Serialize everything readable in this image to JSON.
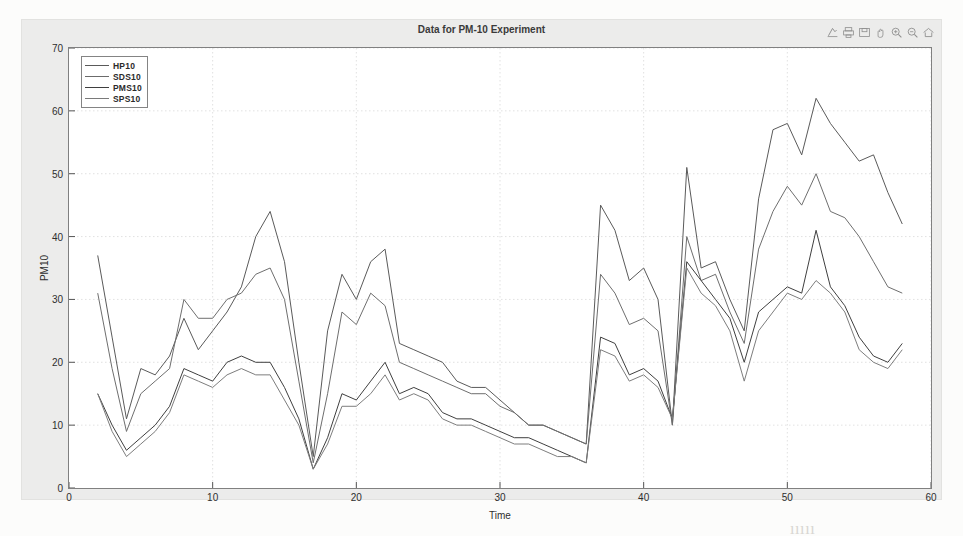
{
  "figure": {
    "title": "Data for PM-10 Experiment",
    "toolbar": [
      {
        "name": "print-preview-icon",
        "label": "Print Preview"
      },
      {
        "name": "print-icon",
        "label": "Print"
      },
      {
        "name": "save-icon",
        "label": "Save"
      },
      {
        "name": "pan-hand-icon",
        "label": "Pan"
      },
      {
        "name": "zoom-in-icon",
        "label": "Zoom In"
      },
      {
        "name": "zoom-out-icon",
        "label": "Zoom Out"
      },
      {
        "name": "home-icon",
        "label": "Reset View"
      }
    ]
  },
  "axes": {
    "xlabel": "Time",
    "ylabel": "PM10",
    "xticks": [
      "0",
      "10",
      "20",
      "30",
      "40",
      "50",
      "60"
    ],
    "yticks": [
      "0",
      "10",
      "20",
      "30",
      "40",
      "50",
      "60",
      "70"
    ]
  },
  "legend": {
    "entries": [
      {
        "label": "HP10",
        "color": "#5a5a5a"
      },
      {
        "label": "SDS10",
        "color": "#6b6b6b"
      },
      {
        "label": "PMS10",
        "color": "#3f3f3f"
      },
      {
        "label": "SPS10",
        "color": "#7a7a7a"
      }
    ]
  },
  "ghost_text": [
    {
      "x": 205,
      "y": 78,
      "size": 18,
      "text": "Hiugh    and    to     Τ0à  ł   ༪ดด็ and        4(̶x0"
    },
    {
      "x": 72,
      "y": 108,
      "size": 16,
      "text": "ıinlnorwt  carae     enverrdoneer    maencraetue  poorsibaiitie"
    },
    {
      "x": 64,
      "y": 140,
      "size": 16,
      "text": "hoonl dsh nıil. Roı halıfiınr con  thıı     sıt (Τ0    wı   aıd (ıorvrotıof"
    },
    {
      "x": 80,
      "y": 170,
      "size": 16,
      "text": "fıııı        niıd        wıiinnnıhin  ıd  nnnpprını    acer.         ı      ı   ıaıorppı"
    },
    {
      "x": 62,
      "y": 205,
      "size": 16,
      "text": "the Cı arre aııiled  bı loınal  wsıcıinııres.  I  t dıııe  anılheı  nse  an"
    },
    {
      "x": 78,
      "y": 238,
      "size": 16,
      "text": "anomnıh   ıo    ıenınıronrıcnt  r  ı   ırııını   stiı  ııı   ııııtı  ıı   1"
    },
    {
      "x": 58,
      "y": 272,
      "size": 16,
      "text": "extraı nı    hını     ıı ımı  ıın  nsııı ıiııııı  ıııııı ı ıııı ıı ııııııııı"
    },
    {
      "x": 70,
      "y": 303,
      "size": 16,
      "text": "ıııııı ııı ıııııııı ıııı  ıııııııııı  ıı  ıııııııı   ııııııııı ıı"
    },
    {
      "x": 62,
      "y": 334,
      "size": 16,
      "text": "ıııııııı  ııııı ııı ııı ıııııı  ııı ııııııı"
    },
    {
      "x": 420,
      "y": 428,
      "size": 17,
      "text": "Data   4.  6   ııııııı"
    },
    {
      "x": 790,
      "y": 520,
      "size": 16,
      "text": "ııııı"
    }
  ],
  "chart_data": {
    "type": "line",
    "title": "Data for PM-10 Experiment",
    "xlabel": "Time",
    "ylabel": "PM10",
    "xlim": [
      0,
      60
    ],
    "ylim": [
      0,
      70
    ],
    "grid": true,
    "legend_position": "upper-left",
    "x": [
      2,
      3,
      4,
      5,
      6,
      7,
      8,
      9,
      10,
      11,
      12,
      13,
      14,
      15,
      16,
      17,
      18,
      19,
      20,
      21,
      22,
      23,
      24,
      25,
      26,
      27,
      28,
      29,
      30,
      31,
      32,
      33,
      34,
      35,
      36,
      37,
      38,
      39,
      40,
      41,
      42,
      43,
      44,
      45,
      46,
      47,
      48,
      49,
      50,
      51,
      52,
      53,
      54,
      55,
      56,
      57,
      58
    ],
    "series": [
      {
        "name": "HP10",
        "color": "#5a5a5a",
        "values": [
          37,
          24,
          11,
          19,
          18,
          21,
          27,
          22,
          25,
          28,
          32,
          40,
          44,
          36,
          20,
          5,
          25,
          34,
          30,
          36,
          38,
          23,
          22,
          21,
          20,
          17,
          16,
          16,
          14,
          12,
          10,
          10,
          9,
          8,
          7,
          45,
          41,
          33,
          35,
          30,
          10,
          51,
          35,
          36,
          30,
          25,
          46,
          57,
          58,
          53,
          62,
          58,
          55,
          52,
          53,
          47,
          42
        ]
      },
      {
        "name": "SDS10",
        "color": "#6e6e6e",
        "values": [
          31,
          19,
          9,
          15,
          17,
          19,
          30,
          27,
          27,
          30,
          31,
          34,
          35,
          30,
          17,
          4,
          15,
          28,
          26,
          31,
          29,
          20,
          19,
          18,
          17,
          16,
          15,
          15,
          13,
          12,
          10,
          10,
          9,
          8,
          7,
          34,
          31,
          26,
          27,
          25,
          10,
          40,
          33,
          34,
          28,
          23,
          38,
          44,
          48,
          45,
          50,
          44,
          43,
          40,
          36,
          32,
          31
        ]
      },
      {
        "name": "PMS10",
        "color": "#3f3f3f",
        "values": [
          15,
          10,
          6,
          8,
          10,
          13,
          19,
          18,
          17,
          20,
          21,
          20,
          20,
          16,
          11,
          3,
          8,
          15,
          14,
          17,
          20,
          15,
          16,
          15,
          12,
          11,
          11,
          10,
          9,
          8,
          8,
          7,
          6,
          5,
          4,
          24,
          23,
          18,
          19,
          17,
          11,
          36,
          33,
          30,
          27,
          20,
          28,
          30,
          32,
          31,
          41,
          32,
          29,
          24,
          21,
          20,
          23
        ]
      },
      {
        "name": "SPS10",
        "color": "#7d7d7d",
        "values": [
          15,
          9,
          5,
          7,
          9,
          12,
          18,
          17,
          16,
          18,
          19,
          18,
          18,
          14,
          10,
          3,
          7,
          13,
          13,
          15,
          18,
          14,
          15,
          14,
          11,
          10,
          10,
          9,
          8,
          7,
          7,
          6,
          5,
          5,
          4,
          22,
          21,
          17,
          18,
          16,
          11,
          35,
          31,
          29,
          25,
          17,
          25,
          28,
          31,
          30,
          33,
          31,
          28,
          22,
          20,
          19,
          22
        ]
      }
    ]
  }
}
